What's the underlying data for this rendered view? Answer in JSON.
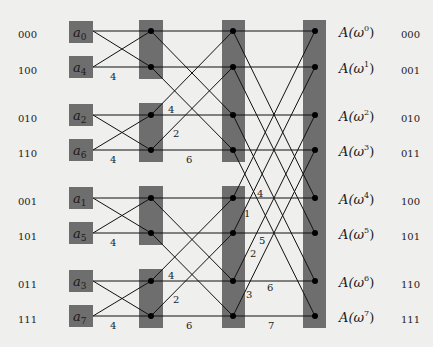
{
  "diagram": {
    "type": "FFT butterfly network (8-point, bit-reversed input)",
    "colors": {
      "background": "#efefed",
      "box": "#6e6e6e",
      "line": "#111111",
      "node": "#000000"
    },
    "input_bit_labels": [
      "000",
      "100",
      "010",
      "110",
      "001",
      "101",
      "011",
      "111"
    ],
    "inputs": [
      {
        "base": "a",
        "sub": "0"
      },
      {
        "base": "a",
        "sub": "4"
      },
      {
        "base": "a",
        "sub": "2"
      },
      {
        "base": "a",
        "sub": "6"
      },
      {
        "base": "a",
        "sub": "1"
      },
      {
        "base": "a",
        "sub": "5"
      },
      {
        "base": "a",
        "sub": "3"
      },
      {
        "base": "a",
        "sub": "7"
      }
    ],
    "outputs": [
      {
        "text": "A(ω",
        "sup": "0",
        "close": ")"
      },
      {
        "text": "A(ω",
        "sup": "1",
        "close": ")"
      },
      {
        "text": "A(ω",
        "sup": "2",
        "close": ")"
      },
      {
        "text": "A(ω",
        "sup": "3",
        "close": ")"
      },
      {
        "text": "A(ω",
        "sup": "4",
        "close": ")"
      },
      {
        "text": "A(ω",
        "sup": "5",
        "close": ")"
      },
      {
        "text": "A(ω",
        "sup": "6",
        "close": ")"
      },
      {
        "text": "A(ω",
        "sup": "7",
        "close": ")"
      }
    ],
    "output_bit_labels": [
      "000",
      "001",
      "010",
      "011",
      "100",
      "101",
      "110",
      "111"
    ],
    "stage1_twiddles": [
      "4",
      "4",
      "4",
      "4"
    ],
    "stage2_twiddles": {
      "top_diag": "4",
      "top_mid": "2",
      "top_bottom": "6",
      "bot_diag": "4",
      "bot_mid": "2",
      "bot_bottom": "6"
    },
    "stage3_twiddles": [
      "4",
      "1",
      "5",
      "2",
      "6",
      "3",
      "7"
    ]
  }
}
